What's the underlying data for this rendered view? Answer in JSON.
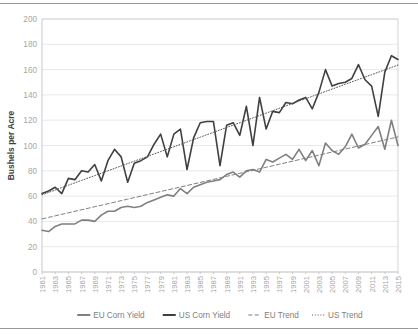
{
  "chart_data": {
    "type": "line",
    "title": "",
    "xlabel": "",
    "ylabel": "Bushels per Acre",
    "ylim": [
      0,
      200
    ],
    "ytick_step": 20,
    "yticks": [
      0,
      20,
      40,
      60,
      80,
      100,
      120,
      140,
      160,
      180,
      200
    ],
    "xlim": [
      1961,
      2015
    ],
    "xtick_step": 2,
    "xticks": [
      1961,
      1963,
      1965,
      1967,
      1969,
      1971,
      1973,
      1975,
      1977,
      1979,
      1981,
      1983,
      1985,
      1987,
      1989,
      1991,
      1993,
      1995,
      1997,
      1999,
      2001,
      2003,
      2005,
      2007,
      2009,
      2011,
      2013,
      2015
    ],
    "grid": true,
    "legend_position": "bottom",
    "x": [
      1961,
      1962,
      1963,
      1964,
      1965,
      1966,
      1967,
      1968,
      1969,
      1970,
      1971,
      1972,
      1973,
      1974,
      1975,
      1976,
      1977,
      1978,
      1979,
      1980,
      1981,
      1982,
      1983,
      1984,
      1985,
      1986,
      1987,
      1988,
      1989,
      1990,
      1991,
      1992,
      1993,
      1994,
      1995,
      1996,
      1997,
      1998,
      1999,
      2000,
      2001,
      2002,
      2003,
      2004,
      2005,
      2006,
      2007,
      2008,
      2009,
      2010,
      2011,
      2012,
      2013,
      2014,
      2015
    ],
    "series": [
      {
        "name": "EU Corn Yield",
        "color": "#808080",
        "style": "solid",
        "values": [
          33,
          32,
          36,
          38,
          38,
          38,
          41,
          41,
          40,
          45,
          48,
          48,
          51,
          52,
          51,
          52,
          55,
          57,
          59,
          61,
          60,
          66,
          62,
          67,
          69,
          71,
          72,
          73,
          77,
          79,
          75,
          80,
          81,
          79,
          89,
          87,
          90,
          93,
          89,
          97,
          88,
          96,
          84,
          102,
          96,
          93,
          99,
          109,
          98,
          101,
          108,
          115,
          97,
          120,
          100
        ]
      },
      {
        "name": "US Corn Yield",
        "color": "#404040",
        "style": "solid",
        "values": [
          62,
          64,
          67,
          62,
          74,
          73,
          80,
          79,
          85,
          72,
          88,
          97,
          91,
          71,
          86,
          88,
          91,
          101,
          109,
          91,
          109,
          113,
          81,
          106,
          118,
          119,
          119,
          84,
          116,
          118,
          108,
          131,
          100,
          138,
          113,
          127,
          126,
          134,
          133,
          136,
          138,
          129,
          142,
          160,
          147,
          149,
          150,
          153,
          164,
          152,
          147,
          123,
          158,
          171,
          168
        ]
      },
      {
        "name": "EU Trend",
        "color": "#7f7f7f",
        "style": "dashed",
        "values": [
          42,
          43.2,
          44.4,
          45.6,
          46.8,
          48,
          49.2,
          50.4,
          51.6,
          52.8,
          54,
          55.2,
          56.4,
          57.6,
          58.8,
          60,
          61.2,
          62.4,
          63.6,
          64.8,
          66,
          67.2,
          68.4,
          69.6,
          70.8,
          72,
          73.2,
          74.4,
          75.6,
          76.8,
          78,
          79.2,
          80.4,
          81.6,
          82.8,
          84,
          85.2,
          86.4,
          87.6,
          88.8,
          90,
          91.2,
          92.4,
          93.6,
          94.8,
          96,
          97.2,
          98.4,
          99.6,
          100.8,
          102,
          103.2,
          104.4,
          105.6,
          106.8
        ]
      },
      {
        "name": "US Trend",
        "color": "#595959",
        "style": "dotted",
        "values": [
          61,
          62.9,
          64.8,
          66.7,
          68.6,
          70.5,
          72.4,
          74.3,
          76.2,
          78.1,
          80,
          81.9,
          83.8,
          85.7,
          87.6,
          89.5,
          91.4,
          93.3,
          95.2,
          97.1,
          99,
          100.9,
          102.8,
          104.7,
          106.6,
          108.5,
          110.4,
          112.3,
          114.2,
          116.1,
          118,
          119.9,
          121.8,
          123.7,
          125.6,
          127.5,
          129.4,
          131.3,
          133.2,
          135.1,
          137,
          138.9,
          140.8,
          142.7,
          144.6,
          146.5,
          148.4,
          150.3,
          152.2,
          154.1,
          156,
          157.9,
          159.8,
          161.7,
          163.6
        ]
      }
    ]
  },
  "legend": {
    "items": [
      {
        "label": "EU Corn Yield"
      },
      {
        "label": "US Corn Yield"
      },
      {
        "label": "EU Trend"
      },
      {
        "label": "US Trend"
      }
    ]
  },
  "colors": {
    "eu_yield": "#808080",
    "us_yield": "#404040",
    "eu_trend": "#7f7f7f",
    "us_trend": "#595959",
    "grid": "#e8e8e8",
    "tick_text": "#a6a6a6",
    "axis_label": "#3f3f3f"
  }
}
